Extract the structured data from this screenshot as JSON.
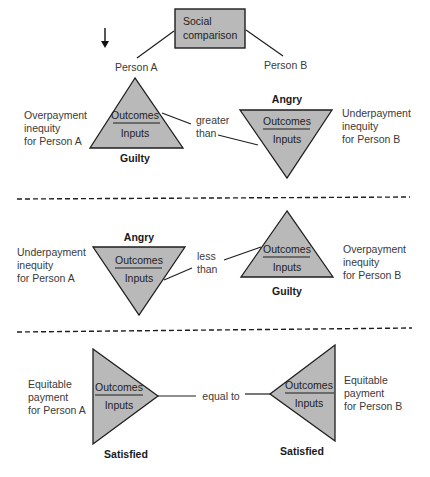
{
  "diagram": {
    "title_box": {
      "line1": "Social",
      "line2": "comparison"
    },
    "persons": {
      "a": "Person A",
      "b": "Person B"
    },
    "colors": {
      "triangle_fill": "#b9b9b9",
      "box_fill": "#b9b9b9",
      "stroke": "#1e1e1e"
    },
    "ratio": {
      "numerator": "Outcomes",
      "denominator": "Inputs"
    },
    "sections": [
      {
        "id": "overpayment-a",
        "left_label": [
          "Overpayment",
          "inequity",
          "for Person A"
        ],
        "right_label": [
          "Underpayment",
          "inequity",
          "for Person B"
        ],
        "comparison": [
          "greater",
          "than"
        ],
        "left_emotion": "Guilty",
        "right_emotion": "Angry"
      },
      {
        "id": "underpayment-a",
        "left_label": [
          "Underpayment",
          "inequity",
          "for Person A"
        ],
        "right_label": [
          "Overpayment",
          "inequity",
          "for Person B"
        ],
        "comparison": [
          "less",
          "than"
        ],
        "left_emotion": "Angry",
        "right_emotion": "Guilty"
      },
      {
        "id": "equitable",
        "left_label": [
          "Equitable",
          "payment",
          "for Person A"
        ],
        "right_label": [
          "Equitable",
          "payment",
          "for Person B"
        ],
        "comparison": [
          "equal to"
        ],
        "left_emotion": "Satisfied",
        "right_emotion": "Satisfied"
      }
    ]
  }
}
